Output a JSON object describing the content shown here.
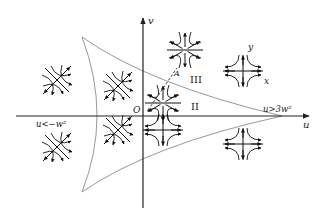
{
  "diagram": {
    "axes": {
      "horizontal_label": "u",
      "vertical_label": "v",
      "origin_label": "O"
    },
    "region_labels": {
      "region_2": "II",
      "region_3": "III",
      "left_condition": "u<−w²",
      "right_condition": "u>3w²"
    },
    "inset_axes": {
      "x_label": "x",
      "y_label": "y"
    },
    "annotation": {
      "point_label": "A"
    },
    "colors": {
      "axis": "#222222",
      "curve": "#999999",
      "portrait": "#111111"
    },
    "phase_portraits": [
      {
        "id": "left-outer",
        "type": "saddle-diagonal"
      },
      {
        "id": "left-inner-upper",
        "type": "saddle-diagonal"
      },
      {
        "id": "left-inner-lower",
        "type": "saddle-diagonal"
      },
      {
        "id": "region-3-top",
        "type": "star-node"
      },
      {
        "id": "region-2-center",
        "type": "star-node"
      },
      {
        "id": "region-2-lower",
        "type": "saddle-cross"
      },
      {
        "id": "right-inset",
        "type": "saddle-cross"
      },
      {
        "id": "right-lower",
        "type": "saddle-cross"
      }
    ]
  }
}
